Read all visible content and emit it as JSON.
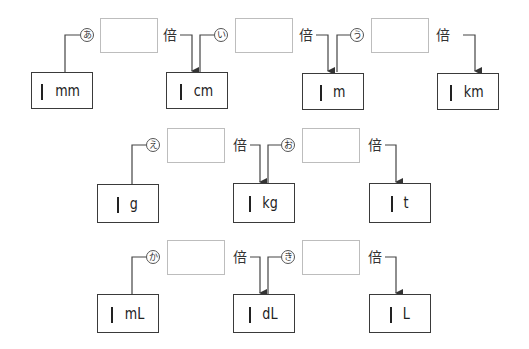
{
  "rows": [
    {
      "units": [
        {
          "one": "1",
          "unit": "mm"
        },
        {
          "one": "1",
          "unit": "cm"
        },
        {
          "one": "1",
          "unit": "m"
        },
        {
          "one": "1",
          "unit": "km"
        }
      ],
      "conversions": [
        {
          "mark": "あ",
          "answer": "",
          "suffix": "倍"
        },
        {
          "mark": "い",
          "answer": "",
          "suffix": "倍"
        },
        {
          "mark": "う",
          "answer": "",
          "suffix": "倍"
        }
      ]
    },
    {
      "units": [
        {
          "one": "1",
          "unit": "g"
        },
        {
          "one": "1",
          "unit": "kg"
        },
        {
          "one": "1",
          "unit": "t"
        }
      ],
      "conversions": [
        {
          "mark": "え",
          "answer": "",
          "suffix": "倍"
        },
        {
          "mark": "お",
          "answer": "",
          "suffix": "倍"
        }
      ]
    },
    {
      "units": [
        {
          "one": "1",
          "unit": "mL"
        },
        {
          "one": "1",
          "unit": "dL"
        },
        {
          "one": "1",
          "unit": "L"
        }
      ],
      "conversions": [
        {
          "mark": "か",
          "answer": "",
          "suffix": "倍"
        },
        {
          "mark": "き",
          "answer": "",
          "suffix": "倍"
        }
      ]
    }
  ],
  "colors": {
    "unit_border": "#3a3a3a",
    "answer_border": "#bdbdbd",
    "line": "#444444"
  }
}
